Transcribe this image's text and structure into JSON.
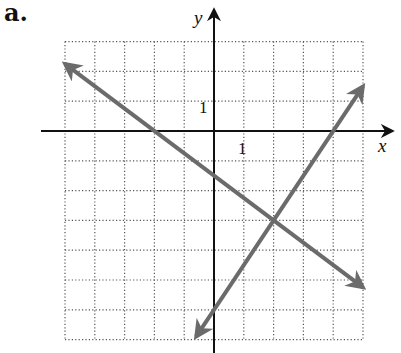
{
  "panel_label": "a.",
  "chart_data": {
    "type": "line",
    "title": "",
    "xlabel": "x",
    "ylabel": "y",
    "xlim": [
      -5,
      5
    ],
    "ylim": [
      -7,
      3
    ],
    "grid": true,
    "grid_style": "dotted",
    "tick_labels": {
      "x": [
        "1"
      ],
      "y": [
        "1"
      ]
    },
    "series": [
      {
        "name": "line-decreasing",
        "equation": "y = -0.75x - 1.5",
        "slope": -0.75,
        "intercept": -1.5,
        "x": [
          -5,
          5
        ],
        "y": [
          2.25,
          -5.25
        ],
        "color": "#6b6b6b",
        "arrows": "both"
      },
      {
        "name": "line-increasing",
        "equation": "y = 1.5x - 6",
        "slope": 1.5,
        "intercept": -6,
        "x": [
          -0.6,
          5
        ],
        "y": [
          -6.9,
          1.5
        ],
        "color": "#6b6b6b",
        "arrows": "both"
      }
    ],
    "intersection": {
      "x": 2,
      "y": -3
    },
    "legend": null
  }
}
